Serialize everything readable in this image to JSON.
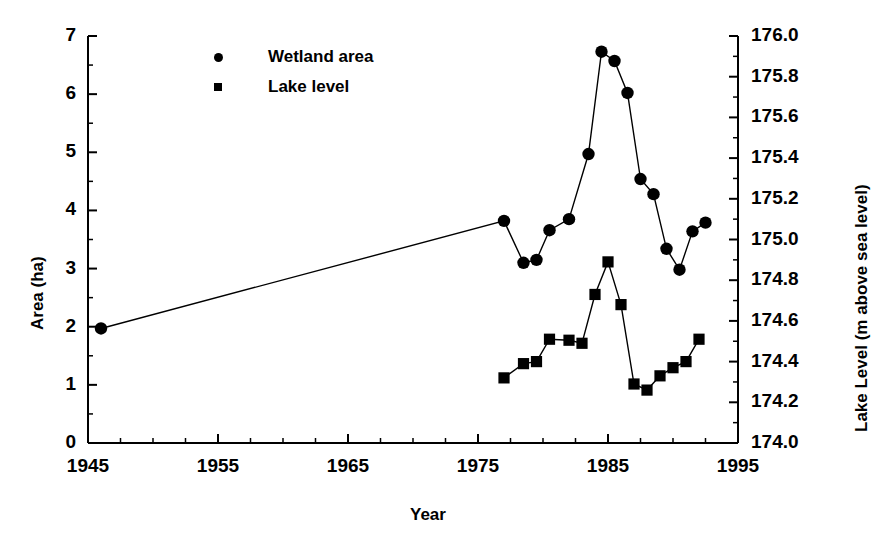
{
  "chart_data": {
    "type": "line",
    "title": "",
    "xlabel": "Year",
    "ylabel": "Area (ha)",
    "y2label": "Lake Level (m above sea level)",
    "xlim": [
      1945,
      1995
    ],
    "ylim": [
      0,
      7
    ],
    "y2lim": [
      174.0,
      176.0
    ],
    "grid": false,
    "legend_position": "top-left-inside",
    "x_ticks": [
      "1945",
      "1955",
      "1965",
      "1975",
      "1985",
      "1995"
    ],
    "x_tick_values": [
      1945,
      1955,
      1965,
      1975,
      1985,
      1995
    ],
    "x_minor_interval": 2.5,
    "y_ticks": [
      "0",
      "1",
      "2",
      "3",
      "4",
      "5",
      "6",
      "7"
    ],
    "y_tick_values": [
      0,
      1,
      2,
      3,
      4,
      5,
      6,
      7
    ],
    "y_minor_interval": 0.5,
    "y2_ticks": [
      "174.0",
      "174.2",
      "174.4",
      "174.6",
      "174.8",
      "175.0",
      "175.2",
      "175.4",
      "175.6",
      "175.8",
      "176.0"
    ],
    "y2_tick_values": [
      174.0,
      174.2,
      174.4,
      174.6,
      174.8,
      175.0,
      175.2,
      175.4,
      175.6,
      175.8,
      176.0
    ],
    "y2_minor_interval": 0.1,
    "series": [
      {
        "name": "Wetland area",
        "marker": "circle",
        "axis": "left",
        "x": [
          1946,
          1977,
          1978.5,
          1979.5,
          1980.5,
          1982,
          1983.5,
          1984.5,
          1985.5,
          1986.5,
          1987.5,
          1988.5,
          1989.5,
          1990.5,
          1991.5,
          1992.5
        ],
        "values": [
          1.97,
          3.82,
          3.1,
          3.15,
          3.66,
          3.85,
          4.97,
          6.73,
          6.57,
          6.02,
          4.54,
          4.28,
          3.34,
          2.98,
          3.64,
          3.79
        ]
      },
      {
        "name": "Lake level",
        "marker": "square",
        "axis": "right",
        "x": [
          1977,
          1978.5,
          1979.5,
          1980.5,
          1982,
          1983,
          1984,
          1985,
          1986,
          1987,
          1988,
          1989,
          1990,
          1991,
          1992
        ],
        "values": [
          174.32,
          174.39,
          174.4,
          174.51,
          174.505,
          174.49,
          174.73,
          174.89,
          174.68,
          174.29,
          174.26,
          174.33,
          174.37,
          174.4,
          174.51
        ]
      }
    ]
  },
  "legend": {
    "items": [
      {
        "label": "Wetland area",
        "marker": "circle"
      },
      {
        "label": "Lake level",
        "marker": "square"
      }
    ]
  },
  "colors": {
    "foreground": "#000000",
    "background": "#ffffff"
  }
}
